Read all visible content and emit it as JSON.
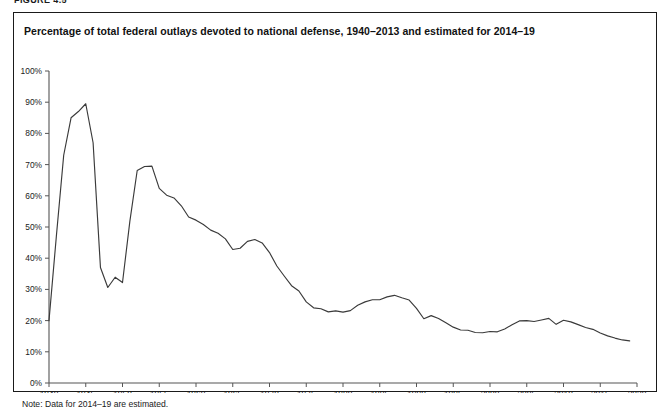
{
  "figure": {
    "number_label": "FIGURE 4.5",
    "title": "Percentage of total federal outlays devoted to national defense, 1940–2013 and estimated for 2014–19",
    "note": "Note: Data for 2014–19 are estimated.",
    "border_color": "#1a1a1a",
    "line_color": "#3a3a3a",
    "background_color": "#ffffff"
  },
  "chart_data": {
    "type": "line",
    "title": "Percentage of total federal outlays devoted to national defense, 1940–2013 and estimated for 2014–19",
    "subtitle": "",
    "xlabel": "",
    "ylabel": "",
    "xlim": [
      1940,
      2020
    ],
    "ylim": [
      0,
      100
    ],
    "grid": false,
    "legend_position": "none",
    "x_tick_labels": [
      "1940",
      "1945",
      "1950",
      "1955",
      "1960",
      "1965",
      "1970",
      "1975",
      "1980",
      "1985",
      "1990",
      "1995",
      "2000",
      "2005",
      "2010",
      "2015",
      "2020"
    ],
    "x_ticks": [
      1940,
      1945,
      1950,
      1955,
      1960,
      1965,
      1970,
      1975,
      1980,
      1985,
      1990,
      1995,
      2000,
      2005,
      2010,
      2015,
      2020
    ],
    "y_tick_labels": [
      "0%",
      "10%",
      "20%",
      "30%",
      "40%",
      "50%",
      "60%",
      "70%",
      "80%",
      "90%",
      "100%"
    ],
    "y_ticks": [
      0,
      10,
      20,
      30,
      40,
      50,
      60,
      70,
      80,
      90,
      100
    ],
    "annotations": [
      "Note: Data for 2014–19 are estimated."
    ],
    "series": [
      {
        "name": "Percentage of total federal outlays devoted to national defense",
        "x": [
          1940,
          1941,
          1942,
          1943,
          1944,
          1945,
          1946,
          1947,
          1948,
          1949,
          1950,
          1951,
          1952,
          1953,
          1954,
          1955,
          1956,
          1957,
          1958,
          1959,
          1960,
          1961,
          1962,
          1963,
          1964,
          1965,
          1966,
          1967,
          1968,
          1969,
          1970,
          1971,
          1972,
          1973,
          1974,
          1975,
          1976,
          1977,
          1978,
          1979,
          1980,
          1981,
          1982,
          1983,
          1984,
          1985,
          1986,
          1987,
          1988,
          1989,
          1990,
          1991,
          1992,
          1993,
          1994,
          1995,
          1996,
          1997,
          1998,
          1999,
          2000,
          2001,
          2002,
          2003,
          2004,
          2005,
          2006,
          2007,
          2008,
          2009,
          2010,
          2011,
          2012,
          2013,
          2014,
          2015,
          2016,
          2017,
          2018,
          2019
        ],
        "values": [
          20.0,
          47.0,
          73.0,
          85.0,
          87.0,
          89.5,
          77.0,
          37.0,
          30.6,
          33.9,
          32.2,
          51.8,
          68.1,
          69.4,
          69.5,
          62.4,
          60.2,
          59.3,
          56.8,
          53.2,
          52.2,
          50.8,
          49.0,
          48.0,
          46.2,
          42.8,
          43.2,
          45.4,
          46.0,
          44.9,
          41.8,
          37.5,
          34.3,
          31.2,
          29.5,
          26.0,
          24.1,
          23.8,
          22.8,
          23.1,
          22.7,
          23.2,
          24.9,
          26.0,
          26.7,
          26.7,
          27.6,
          28.1,
          27.3,
          26.6,
          23.9,
          20.6,
          21.6,
          20.7,
          19.3,
          17.9,
          17.0,
          16.9,
          16.2,
          16.1,
          16.5,
          16.4,
          17.3,
          18.7,
          19.9,
          20.0,
          19.7,
          20.2,
          20.7,
          18.8,
          20.1,
          19.6,
          18.7,
          17.8,
          17.2,
          16.0,
          15.1,
          14.4,
          13.8,
          13.5
        ]
      }
    ]
  }
}
